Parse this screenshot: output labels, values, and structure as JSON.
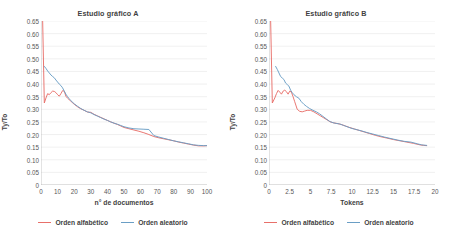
{
  "chart_data": [
    {
      "type": "line",
      "title": "Estudio gráfico A",
      "xlabel": "n° de documentos",
      "ylabel": "Ty/To",
      "xlim": [
        0,
        100
      ],
      "ylim": [
        0,
        0.65
      ],
      "grid": "horizontal",
      "legend_position": "bottom",
      "xticks": [
        "0",
        "10",
        "20",
        "30",
        "40",
        "50",
        "60",
        "70",
        "80",
        "90",
        "100"
      ],
      "xtick_values": [
        0,
        10,
        20,
        30,
        40,
        50,
        60,
        70,
        80,
        90,
        100
      ],
      "yticks": [
        "0",
        "0.05",
        "0.10",
        "0.15",
        "0.20",
        "0.25",
        "0.30",
        "0.35",
        "0.40",
        "0.45",
        "0.50",
        "0.55",
        "0.60",
        "0.65"
      ],
      "ytick_values": [
        0,
        0.05,
        0.1,
        0.15,
        0.2,
        0.25,
        0.3,
        0.35,
        0.4,
        0.45,
        0.5,
        0.55,
        0.6,
        0.65
      ],
      "series": [
        {
          "name": "Orden alfabético",
          "color": "#e8706a",
          "x": [
            1,
            2,
            3,
            4,
            5,
            6,
            7,
            8,
            9,
            10,
            11,
            12,
            13,
            14,
            15,
            16,
            17,
            18,
            20,
            22,
            24,
            26,
            28,
            30,
            32,
            34,
            36,
            38,
            40,
            42,
            44,
            46,
            48,
            50,
            53,
            56,
            59,
            62,
            65,
            68,
            71,
            74,
            77,
            80,
            83,
            86,
            89,
            92,
            95,
            98,
            100
          ],
          "values": [
            0.65,
            0.325,
            0.345,
            0.362,
            0.358,
            0.366,
            0.372,
            0.371,
            0.366,
            0.358,
            0.352,
            0.362,
            0.374,
            0.372,
            0.352,
            0.344,
            0.338,
            0.332,
            0.32,
            0.31,
            0.302,
            0.296,
            0.289,
            0.288,
            0.28,
            0.274,
            0.268,
            0.262,
            0.256,
            0.25,
            0.245,
            0.24,
            0.234,
            0.228,
            0.223,
            0.218,
            0.213,
            0.207,
            0.2,
            0.192,
            0.187,
            0.183,
            0.179,
            0.175,
            0.17,
            0.166,
            0.162,
            0.158,
            0.155,
            0.155,
            0.156
          ]
        },
        {
          "name": "Orden aleatorio",
          "color": "#6a9ec5",
          "x": [
            2,
            3,
            4,
            5,
            6,
            7,
            8,
            9,
            10,
            11,
            12,
            13,
            14,
            15,
            16,
            17,
            18,
            20,
            22,
            24,
            26,
            28,
            30,
            32,
            34,
            36,
            38,
            40,
            42,
            44,
            46,
            48,
            50,
            53,
            56,
            59,
            62,
            65,
            68,
            71,
            74,
            77,
            80,
            83,
            86,
            89,
            92,
            95,
            98,
            100
          ],
          "values": [
            0.47,
            0.462,
            0.452,
            0.444,
            0.436,
            0.43,
            0.425,
            0.416,
            0.408,
            0.4,
            0.394,
            0.385,
            0.372,
            0.36,
            0.35,
            0.342,
            0.334,
            0.322,
            0.312,
            0.303,
            0.296,
            0.29,
            0.286,
            0.279,
            0.273,
            0.267,
            0.261,
            0.256,
            0.25,
            0.245,
            0.241,
            0.236,
            0.231,
            0.226,
            0.223,
            0.222,
            0.221,
            0.22,
            0.196,
            0.19,
            0.185,
            0.18,
            0.175,
            0.171,
            0.167,
            0.163,
            0.159,
            0.157,
            0.156,
            0.156
          ]
        }
      ]
    },
    {
      "type": "line",
      "title": "Estudio gráfico B",
      "xlabel": "Tokens",
      "ylabel": "Ty/To",
      "xlim": [
        0,
        20
      ],
      "ylim": [
        0,
        0.65
      ],
      "grid": "horizontal",
      "legend_position": "bottom",
      "xticks": [
        "0",
        "2.5",
        "5",
        "7.5",
        "10",
        "12.5",
        "15",
        "17.5",
        "20"
      ],
      "xtick_values": [
        0,
        2.5,
        5,
        7.5,
        10,
        12.5,
        15,
        17.5,
        20
      ],
      "yticks": [
        "0",
        "0.05",
        "0.10",
        "0.15",
        "0.20",
        "0.25",
        "0.30",
        "0.35",
        "0.40",
        "0.45",
        "0.50",
        "0.55",
        "0.60",
        "0.65"
      ],
      "ytick_values": [
        0,
        0.05,
        0.1,
        0.15,
        0.2,
        0.25,
        0.3,
        0.35,
        0.4,
        0.45,
        0.5,
        0.55,
        0.6,
        0.65
      ],
      "series": [
        {
          "name": "Orden alfabético",
          "color": "#e8706a",
          "x": [
            0.2,
            0.4,
            0.7,
            0.9,
            1.1,
            1.3,
            1.5,
            1.7,
            1.9,
            2.1,
            2.3,
            2.5,
            2.7,
            2.9,
            3.1,
            3.4,
            3.7,
            4.0,
            4.3,
            4.6,
            5.0,
            5.4,
            5.8,
            6.2,
            6.6,
            7.0,
            7.4,
            7.8,
            8.2,
            8.7,
            9.2,
            9.7,
            10.3,
            10.9,
            11.5,
            12.1,
            12.8,
            13.5,
            14.2,
            15.0,
            15.8,
            16.6,
            17.4,
            18.2,
            18.6,
            19.0
          ],
          "values": [
            0.65,
            0.325,
            0.345,
            0.362,
            0.375,
            0.368,
            0.36,
            0.372,
            0.376,
            0.37,
            0.36,
            0.372,
            0.368,
            0.35,
            0.33,
            0.3,
            0.292,
            0.29,
            0.293,
            0.296,
            0.296,
            0.29,
            0.282,
            0.274,
            0.266,
            0.258,
            0.25,
            0.246,
            0.244,
            0.24,
            0.234,
            0.228,
            0.222,
            0.216,
            0.21,
            0.204,
            0.197,
            0.191,
            0.186,
            0.18,
            0.175,
            0.17,
            0.165,
            0.159,
            0.157,
            0.156
          ]
        },
        {
          "name": "Orden aleatorio",
          "color": "#6a9ec5",
          "x": [
            0.8,
            1.0,
            1.2,
            1.4,
            1.6,
            1.8,
            2.0,
            2.2,
            2.4,
            2.6,
            2.8,
            3.0,
            3.3,
            3.6,
            3.9,
            4.2,
            4.5,
            4.9,
            5.3,
            5.7,
            6.1,
            6.5,
            6.9,
            7.3,
            7.7,
            8.1,
            8.5,
            9.0,
            9.5,
            10.0,
            10.6,
            11.2,
            11.8,
            12.5,
            13.2,
            13.9,
            14.7,
            15.5,
            16.3,
            17.1,
            17.9,
            18.4,
            19.0
          ],
          "values": [
            0.47,
            0.458,
            0.444,
            0.43,
            0.424,
            0.418,
            0.404,
            0.398,
            0.392,
            0.376,
            0.366,
            0.358,
            0.35,
            0.344,
            0.33,
            0.32,
            0.312,
            0.303,
            0.296,
            0.29,
            0.282,
            0.272,
            0.262,
            0.252,
            0.247,
            0.244,
            0.242,
            0.236,
            0.23,
            0.224,
            0.219,
            0.214,
            0.208,
            0.202,
            0.196,
            0.19,
            0.184,
            0.178,
            0.173,
            0.17,
            0.163,
            0.159,
            0.157
          ]
        }
      ]
    }
  ],
  "panels": [
    {
      "title": "Estudio gráfico A",
      "ylabel": "Ty/To",
      "xlabel": "n° de documentos",
      "legend": [
        {
          "label": "Orden alfabético",
          "color": "#e8706a"
        },
        {
          "label": "Orden aleatorio",
          "color": "#6a9ec5"
        }
      ]
    },
    {
      "title": "Estudio gráfico B",
      "ylabel": "Ty/To",
      "xlabel": "Tokens",
      "legend": [
        {
          "label": "Orden alfabético",
          "color": "#e8706a"
        },
        {
          "label": "Orden aleatorio",
          "color": "#6a9ec5"
        }
      ]
    }
  ],
  "colors": {
    "background": "#ffffff",
    "gridline": "#e6e6e6",
    "axis": "#b0b0b0",
    "text": "#3f3f3f",
    "tick_text": "#585858",
    "series_alphabetical": "#e8706a",
    "series_random": "#6a9ec5"
  }
}
